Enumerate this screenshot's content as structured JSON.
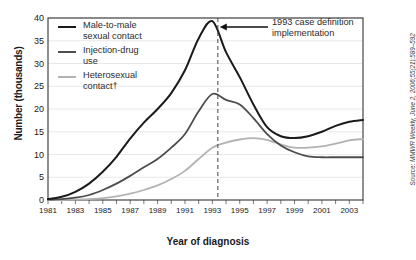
{
  "chart_data": {
    "type": "line",
    "title": "",
    "xlabel": "Year of diagnosis",
    "ylabel": "Number (thousands)",
    "xlim": [
      1981,
      2004
    ],
    "ylim": [
      0,
      40
    ],
    "yticks": [
      0,
      5,
      10,
      15,
      20,
      25,
      30,
      35,
      40
    ],
    "xticks": [
      1981,
      1982,
      1983,
      1984,
      1985,
      1986,
      1987,
      1988,
      1989,
      1990,
      1991,
      1992,
      1993,
      1994,
      1995,
      1996,
      1997,
      1998,
      1999,
      2000,
      2001,
      2002,
      2003,
      2004
    ],
    "xtick_labels": [
      "1981",
      "",
      "1983",
      "",
      "1985",
      "",
      "1987",
      "",
      "1989",
      "",
      "1991",
      "",
      "1993",
      "",
      "1995",
      "",
      "1997",
      "",
      "1999",
      "",
      "2001",
      "",
      "2003",
      ""
    ],
    "grid": "horizontal",
    "legend_position": "upper-left-inside",
    "x": [
      1981,
      1982,
      1983,
      1984,
      1985,
      1986,
      1987,
      1988,
      1989,
      1990,
      1991,
      1992,
      1993,
      1994,
      1995,
      1996,
      1997,
      1998,
      1999,
      2000,
      2001,
      2002,
      2003,
      2004
    ],
    "series": [
      {
        "name": "Male-to-male sexual contact",
        "color": "#1a1a1a",
        "values": [
          0.2,
          0.7,
          1.8,
          3.6,
          6.2,
          9.5,
          13.5,
          17.0,
          20.0,
          23.5,
          28.5,
          35.5,
          39.3,
          32.5,
          27.0,
          21.0,
          16.0,
          14.0,
          13.6,
          14.0,
          15.0,
          16.3,
          17.2,
          17.6
        ]
      },
      {
        "name": "Injection-drug use",
        "color": "#4d4d4d",
        "values": [
          0.1,
          0.2,
          0.5,
          1.1,
          2.2,
          3.6,
          5.3,
          7.2,
          9.0,
          11.5,
          14.5,
          19.5,
          23.3,
          22.0,
          21.0,
          18.0,
          14.5,
          12.0,
          10.5,
          9.6,
          9.4,
          9.4,
          9.4,
          9.4
        ]
      },
      {
        "name": "Heterosexual contact†",
        "color": "#b3b3b3",
        "values": [
          0.0,
          0.0,
          0.1,
          0.2,
          0.4,
          0.8,
          1.4,
          2.2,
          3.2,
          4.6,
          6.4,
          9.0,
          11.5,
          12.6,
          13.3,
          13.6,
          13.2,
          12.2,
          11.5,
          11.5,
          11.8,
          12.4,
          13.1,
          13.4
        ]
      }
    ],
    "annotations": [
      {
        "name": "1993-case-definition-marker",
        "text_line1": "1993 case definition",
        "text_line2": "implementation",
        "x_value": 1993.4,
        "style": "dashed-vertical-line-with-left-arrow"
      }
    ],
    "source": {
      "lead": "Source: ",
      "text": "MMWR Weekly, June 2, 2006;55(21):589–592"
    }
  },
  "legend": {
    "items": [
      {
        "label_line1": "Male-to-male",
        "label_line2": "sexual contact",
        "color": "#1a1a1a"
      },
      {
        "label_line1": "Injection-drug",
        "label_line2": "use",
        "color": "#4d4d4d"
      },
      {
        "label_line1": "Heterosexual",
        "label_line2": "contact†",
        "color": "#b3b3b3"
      }
    ]
  }
}
